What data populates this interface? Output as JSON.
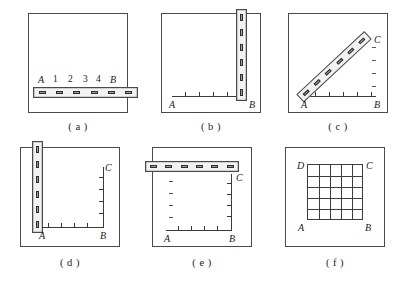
{
  "figure": {
    "background_color": "#ffffff",
    "line_color": "#4a4a4a",
    "ruler_fill": "#f2f2f2",
    "slot_fill": "#9b9b9b"
  },
  "panels": [
    {
      "id": "a",
      "caption": "( a )",
      "description": "Square frame with horizontal ruler near bottom",
      "ruler": {
        "orientation": "horizontal",
        "slots": 6
      },
      "labels": {
        "left": "A",
        "right": "B"
      },
      "numbers": [
        "1",
        "2",
        "3",
        "4"
      ],
      "axis": {
        "horizontal": false,
        "vertical": false
      }
    },
    {
      "id": "b",
      "caption": "( b )",
      "description": "Square frame with vertical ruler at right edge and horizontal axis",
      "ruler": {
        "orientation": "vertical",
        "slots": 6
      },
      "labels": {
        "left": "A",
        "right": "B"
      },
      "axis": {
        "horizontal": true,
        "vertical": false,
        "h_ticks": 5
      }
    },
    {
      "id": "c",
      "caption": "( c )",
      "description": "Square frame with diagonal ruler from A to C, horizontal axis and right-side dashes",
      "ruler": {
        "orientation": "diagonal",
        "slots": 6
      },
      "labels": {
        "left": "A",
        "right": "B",
        "top_right": "C"
      },
      "axis": {
        "horizontal": true,
        "vertical": false,
        "h_ticks": 5
      },
      "dashes": 4
    },
    {
      "id": "d",
      "caption": "( d )",
      "description": "Square frame with vertical ruler at left edge, L-shaped axes A-B and B-C",
      "ruler": {
        "orientation": "vertical",
        "slots": 6
      },
      "labels": {
        "left": "A",
        "right": "B",
        "top_right": "C"
      },
      "axis": {
        "horizontal": true,
        "vertical": true,
        "h_ticks": 5,
        "v_ticks": 5
      }
    },
    {
      "id": "e",
      "caption": "( e )",
      "description": "Square frame with horizontal ruler at top, L-shaped axes A-B and B-C, left dashes",
      "ruler": {
        "orientation": "horizontal",
        "slots": 6
      },
      "labels": {
        "left": "A",
        "right": "B",
        "top_right": "C"
      },
      "axis": {
        "horizontal": true,
        "vertical": true,
        "h_ticks": 5,
        "v_ticks": 5
      },
      "dashes": 4
    },
    {
      "id": "f",
      "caption": "( f )",
      "description": "Square frame containing a 5 by 5 grid with corners labelled",
      "grid": {
        "rows": 5,
        "cols": 5
      },
      "labels": {
        "bottom_left": "A",
        "bottom_right": "B",
        "top_right": "C",
        "top_left": "D"
      }
    }
  ]
}
